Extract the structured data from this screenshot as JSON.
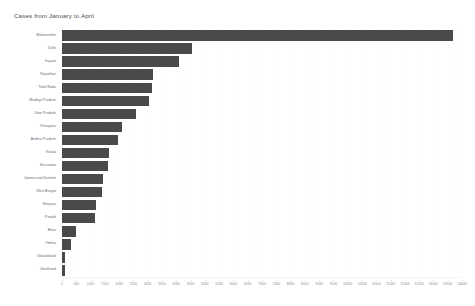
{
  "chart_data": {
    "type": "bar",
    "orientation": "horizontal",
    "title": "Cases from January to April",
    "xlabel": "",
    "ylabel": "",
    "xlim": [
      0,
      14000
    ],
    "ylim": null,
    "grid": true,
    "legend": null,
    "bar_color": "#4a4a4a",
    "background_color": "#ffffff",
    "xticks": [
      0,
      500,
      1000,
      1500,
      2000,
      2500,
      3000,
      3500,
      4000,
      4500,
      5000,
      5500,
      6000,
      6500,
      7000,
      7500,
      8000,
      8500,
      9000,
      9500,
      10000,
      10500,
      11000,
      11500,
      12000,
      12500,
      13000,
      13500,
      14000
    ],
    "xtick_labels": [
      "0",
      "500",
      "1000",
      "1500",
      "2000",
      "2500",
      "3000",
      "3500",
      "4000",
      "4500",
      "5000",
      "5500",
      "6000",
      "6500",
      "7000",
      "7500",
      "8000",
      "8500",
      "9000",
      "9500",
      "10000",
      "10500",
      "11000",
      "11500",
      "12000",
      "12500",
      "13000",
      "13500",
      "14000"
    ],
    "categories": [
      "Maharashtra",
      "Delhi",
      "Gujarat",
      "Rajasthan",
      "Tamil Nadu",
      "Madhya Pradesh",
      "Uttar Pradesh",
      "Telangana",
      "Andhra Pradesh",
      "Kerala",
      "Karnataka",
      "Jammu and Kashmir",
      "West Bengal",
      "Haryana",
      "Punjab",
      "Bihar",
      "Odisha",
      "Uttarakhand",
      "Jharkhand"
    ],
    "values": [
      13700,
      4550,
      4100,
      3200,
      3150,
      3050,
      2600,
      2100,
      1950,
      1650,
      1600,
      1450,
      1400,
      1200,
      1150,
      500,
      320,
      120,
      110
    ]
  }
}
